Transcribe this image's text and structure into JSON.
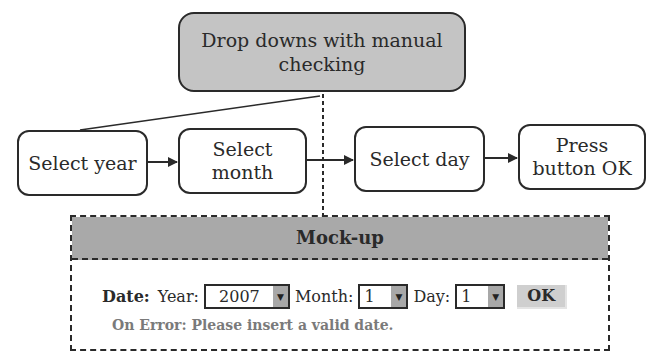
{
  "diagram": {
    "top_node": {
      "label": "Drop downs with manual checking"
    },
    "steps": [
      {
        "label": "Select year"
      },
      {
        "label": "Select month"
      },
      {
        "label": "Select day"
      },
      {
        "label": "Press button OK"
      }
    ]
  },
  "mockup": {
    "title": "Mock-up",
    "date_label": "Date:",
    "year": {
      "label": "Year:",
      "value": "2007"
    },
    "month": {
      "label": "Month:",
      "value": "1"
    },
    "day": {
      "label": "Day:",
      "value": "1"
    },
    "ok_label": "OK",
    "error_text": "On Error: Please insert a valid date."
  },
  "icons": {
    "dropdown_arrow": "▼"
  },
  "colors": {
    "top_node_fill": "#c4c4c4",
    "mock_header_fill": "#a9a9a9",
    "error_text": "#7a7a7a",
    "stroke": "#2a2a2a"
  }
}
